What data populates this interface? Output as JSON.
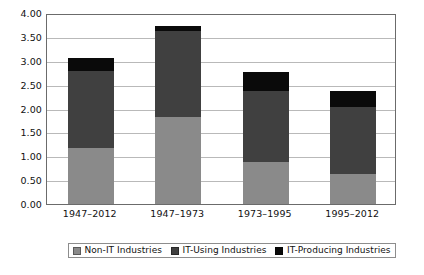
{
  "chart_data": {
    "type": "bar",
    "stacked": true,
    "title": "",
    "subtitle": "",
    "xlabel": "",
    "ylabel": "",
    "categories": [
      "1947–2012",
      "1947–1973",
      "1973–1995",
      "1995–2012"
    ],
    "series": [
      {
        "name": "Non-IT Industries",
        "color": "#8a8a8a",
        "values": [
          1.18,
          1.83,
          0.87,
          0.63
        ]
      },
      {
        "name": "IT-Using Industries",
        "color": "#404040",
        "values": [
          1.6,
          1.79,
          1.49,
          1.4
        ]
      },
      {
        "name": "IT-Producing Industries",
        "color": "#0a0a0a",
        "values": [
          0.27,
          0.11,
          0.4,
          0.34
        ]
      }
    ],
    "totals": [
      3.05,
      3.73,
      2.76,
      2.37
    ],
    "ylim": [
      0.0,
      4.0
    ],
    "ytick_step": 0.5,
    "ytick_labels": [
      "4.00",
      "3.50",
      "3.00",
      "2.50",
      "2.00",
      "1.50",
      "1.00",
      "0.50",
      "0.00"
    ],
    "ytick_values": [
      4.0,
      3.5,
      3.0,
      2.5,
      2.0,
      1.5,
      1.0,
      0.5,
      0.0
    ],
    "grid": true,
    "legend_position": "bottom"
  },
  "legend": {
    "items": [
      {
        "label": "Non-IT Industries",
        "color": "#8a8a8a",
        "swatch_name": "legend-swatch-non-it"
      },
      {
        "label": "IT-Using Industries",
        "color": "#404040",
        "swatch_name": "legend-swatch-it-using"
      },
      {
        "label": "IT-Producing Industries",
        "color": "#0a0a0a",
        "swatch_name": "legend-swatch-it-producing"
      }
    ]
  }
}
